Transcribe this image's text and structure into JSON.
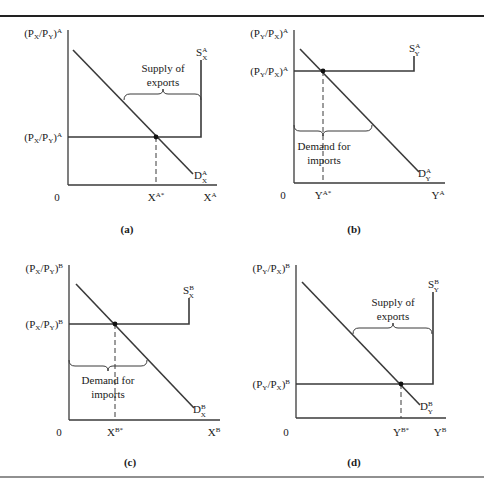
{
  "figure": {
    "panels": [
      {
        "id": "a",
        "caption": "(a)",
        "y_axis_label": "(Pₓ/Pᵧ)",
        "y_axis": {
          "num": "P",
          "num_sub": "X",
          "den": "P",
          "den_sub": "Y",
          "sup": "A"
        },
        "price_level": {
          "num": "P",
          "num_sub": "X",
          "den": "P",
          "den_sub": "Y",
          "sup": "A"
        },
        "origin": "0",
        "x_axis": {
          "base": "X",
          "sup": "A"
        },
        "eq_tick": {
          "base": "X",
          "sup": "A*"
        },
        "supply": {
          "base": "S",
          "sub": "X",
          "sup": "A"
        },
        "demand": {
          "base": "D",
          "sub": "X",
          "sup": "A"
        },
        "brace_text": [
          "Supply of",
          "exports"
        ]
      },
      {
        "id": "b",
        "caption": "(b)",
        "y_axis": {
          "num": "P",
          "num_sub": "Y",
          "den": "P",
          "den_sub": "X",
          "sup": "A"
        },
        "price_level": {
          "num": "P",
          "num_sub": "Y",
          "den": "P",
          "den_sub": "X",
          "sup": "A"
        },
        "origin": "0",
        "x_axis": {
          "base": "Y",
          "sup": "A"
        },
        "eq_tick": {
          "base": "Y",
          "sup": "A*"
        },
        "supply": {
          "base": "S",
          "sub": "Y",
          "sup": "A"
        },
        "demand": {
          "base": "D",
          "sub": "Y",
          "sup": "A"
        },
        "brace_text": [
          "Demand for",
          "imports"
        ]
      },
      {
        "id": "c",
        "caption": "(c)",
        "y_axis": {
          "num": "P",
          "num_sub": "X",
          "den": "P",
          "den_sub": "Y",
          "sup": "B"
        },
        "price_level": {
          "num": "P",
          "num_sub": "X",
          "den": "P",
          "den_sub": "Y",
          "sup": "B"
        },
        "origin": "0",
        "x_axis": {
          "base": "X",
          "sup": "B"
        },
        "eq_tick": {
          "base": "X",
          "sup": "B*"
        },
        "supply": {
          "base": "S",
          "sub": "X",
          "sup": "B"
        },
        "demand": {
          "base": "D",
          "sub": "X",
          "sup": "B"
        },
        "brace_text": [
          "Demand for",
          "imports"
        ]
      },
      {
        "id": "d",
        "caption": "(d)",
        "y_axis": {
          "num": "P",
          "num_sub": "Y",
          "den": "P",
          "den_sub": "X",
          "sup": "B"
        },
        "price_level": {
          "num": "P",
          "num_sub": "Y",
          "den": "P",
          "den_sub": "X",
          "sup": "B"
        },
        "origin": "0",
        "x_axis": {
          "base": "Y",
          "sup": "B"
        },
        "eq_tick": {
          "base": "Y",
          "sup": "B*"
        },
        "supply": {
          "base": "S",
          "sub": "Y",
          "sup": "B"
        },
        "demand": {
          "base": "D",
          "sub": "Y",
          "sup": "B"
        },
        "brace_text": [
          "Supply of",
          "exports"
        ]
      }
    ]
  }
}
